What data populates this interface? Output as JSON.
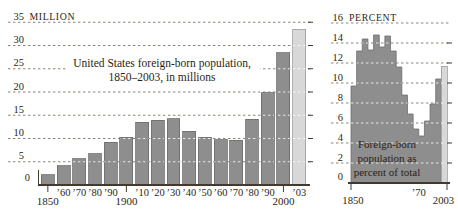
{
  "palette": {
    "background": "#ffffff",
    "bar_fill": "#8e8e8e",
    "bar_stroke": "#6d6d6d",
    "highlight_fill": "#d8d8d8",
    "highlight_stroke": "#9e9e9e",
    "text": "#2b1f15",
    "gridline": "#8c8074",
    "axis": "#43392e",
    "overlay_dash": "rgba(255,255,255,0.8)"
  },
  "chart_data": [
    {
      "id": "foreign-born-millions",
      "type": "bar",
      "title": "United States foreign-born population, 1850–2003, in millions",
      "title_lines": [
        "United States foreign-born population,",
        "1850–2003, in millions"
      ],
      "unit_label": "MILLION",
      "categories": [
        "1850",
        "’60",
        "’70",
        "’80",
        "’90",
        "1900",
        "’10",
        "’20",
        "’30",
        "’40",
        "’50",
        "’60",
        "’70",
        "’80",
        "’90",
        "2000",
        "’03"
      ],
      "values": [
        2.2,
        4.1,
        5.6,
        6.7,
        9.2,
        10.3,
        13.5,
        13.9,
        14.2,
        11.6,
        10.3,
        9.7,
        9.6,
        14.1,
        19.8,
        28.4,
        33.5
      ],
      "major_x_labels": [
        "1850",
        "1900",
        "2000"
      ],
      "highlight_last": true,
      "ylim": [
        0,
        35
      ],
      "ytick_step": 5,
      "ytick_labels": [
        "0",
        "5",
        "10",
        "15",
        "20",
        "25",
        "30",
        "35"
      ],
      "grid": "dashed",
      "legend": "none"
    },
    {
      "id": "foreign-born-percent",
      "type": "area",
      "annotation": "Foreign-born population as percent of total",
      "annotation_lines": [
        "Foreign-born",
        "population as",
        "percent of total"
      ],
      "unit_label": "PERCENT",
      "categories": [
        "1850",
        "1860",
        "1870",
        "1880",
        "1890",
        "1900",
        "1910",
        "1920",
        "1930",
        "1940",
        "1950",
        "1960",
        "1970",
        "1980",
        "1990",
        "2000",
        "2003"
      ],
      "values": [
        9.7,
        13.2,
        14.4,
        13.3,
        14.8,
        13.6,
        14.7,
        13.2,
        11.6,
        8.8,
        6.9,
        5.4,
        4.7,
        6.2,
        7.9,
        10.4,
        11.7
      ],
      "x_axis_labels": [
        {
          "label": "1850",
          "boundary_index": 0,
          "tick": true,
          "row": "lower"
        },
        {
          "label": "’70",
          "boundary_index": 12,
          "tick": false,
          "row": "upper"
        },
        {
          "label": "2003",
          "boundary_index": 17,
          "tick": true,
          "row": "lower"
        }
      ],
      "highlight_last": true,
      "ylim": [
        0,
        16
      ],
      "ytick_step": 2,
      "ytick_labels": [
        "0",
        "2",
        "4",
        "6",
        "8",
        "10",
        "12",
        "14",
        "16"
      ],
      "grid": "dashed",
      "legend": "none"
    }
  ]
}
